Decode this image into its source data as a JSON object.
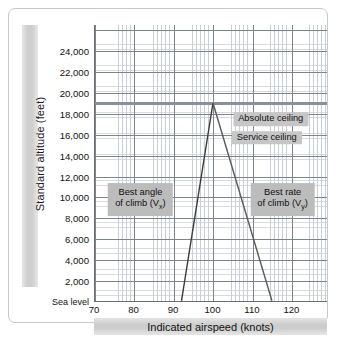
{
  "chart_data": {
    "type": "line",
    "title": "",
    "xlabel": "Indicated airspeed (knots)",
    "ylabel": "Standard altitude (feet)",
    "xlim": [
      70,
      129
    ],
    "ylim": [
      0,
      26500
    ],
    "grid": true,
    "legend": "none",
    "xticks": [
      {
        "value": 70,
        "label": "70"
      },
      {
        "value": 80,
        "label": "80"
      },
      {
        "value": 90,
        "label": "90"
      },
      {
        "value": 100,
        "label": "100"
      },
      {
        "value": 110,
        "label": "110"
      },
      {
        "value": 120,
        "label": "120"
      }
    ],
    "yticks": [
      {
        "value": 24000,
        "label": "24,000"
      },
      {
        "value": 22000,
        "label": "22,000"
      },
      {
        "value": 20000,
        "label": "20,000"
      },
      {
        "value": 18000,
        "label": "18,000"
      },
      {
        "value": 16000,
        "label": "16,000"
      },
      {
        "value": 14000,
        "label": "14,000"
      },
      {
        "value": 12000,
        "label": "12,000"
      },
      {
        "value": 10000,
        "label": "10,000"
      },
      {
        "value": 8000,
        "label": "8,000"
      },
      {
        "value": 6000,
        "label": "6,000"
      },
      {
        "value": 4000,
        "label": "4,000"
      },
      {
        "value": 2000,
        "label": "2,000"
      },
      {
        "value": 0,
        "label": "Sea level"
      }
    ],
    "series": [
      {
        "name": "Best angle of climb (Vx)",
        "color": "#3c3c3c",
        "points": [
          [
            92,
            0
          ],
          [
            100,
            19000
          ]
        ]
      },
      {
        "name": "Best rate of climb (Vy)",
        "color": "#5a5a5a",
        "points": [
          [
            100,
            19000
          ],
          [
            115,
            0
          ]
        ]
      }
    ],
    "reference_lines": [
      {
        "name": "absolute-ceiling",
        "orientation": "horizontal",
        "value": 19000,
        "color": "#8a9099"
      }
    ],
    "annotations": [
      {
        "name": "absolute-ceiling-label",
        "text": "Absolute ceiling",
        "x": 114.5,
        "y": 17500
      },
      {
        "name": "service-ceiling-label",
        "text": "Service ceiling",
        "x": 113.5,
        "y": 15700
      },
      {
        "name": "best-angle-box",
        "line1": "Best angle",
        "line2": "of climb (V",
        "sub": "x",
        "tail": ")",
        "x": 81.5,
        "y": 9800
      },
      {
        "name": "best-rate-box",
        "line1": "Best rate",
        "line2": "of climb (V",
        "sub": "y",
        "tail": ")",
        "x": 117.5,
        "y": 9800
      }
    ]
  },
  "colors": {
    "axis": "#6e6e6e",
    "major_grid": "#7d848c",
    "minor_grid": "#c9cfd6",
    "band": "#cfcfcf",
    "callout": "#c6c6c6"
  }
}
